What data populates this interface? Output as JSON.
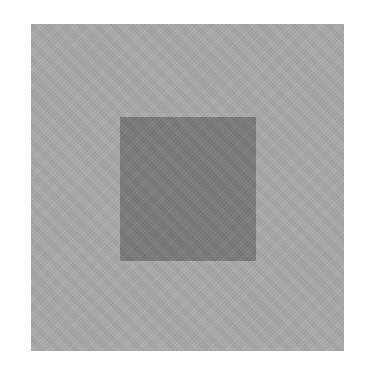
{
  "scene": {
    "background_color": "#ffffff",
    "outer_square": {
      "color": "#acacac",
      "x": 31,
      "y": 24,
      "width": 313,
      "height": 327
    },
    "inner_square": {
      "color": "#7c7c7c",
      "x": 120,
      "y": 117,
      "width": 136,
      "height": 144
    }
  }
}
